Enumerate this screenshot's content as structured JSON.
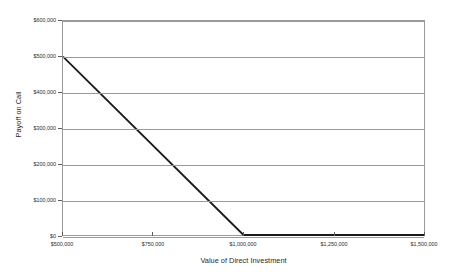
{
  "chart_data": {
    "type": "line",
    "title": "",
    "xlabel": "Value of Direct Investment",
    "ylabel": "Payoff on Call",
    "xlim": [
      500000,
      1500000
    ],
    "ylim": [
      0,
      600000
    ],
    "grid": "horizontal",
    "legend": "none",
    "x_tick_labels": [
      "$500,000",
      "$750,000",
      "$1,000,000",
      "$1,250,000",
      "$1,500,000"
    ],
    "x_ticks": [
      500000,
      750000,
      1000000,
      1250000,
      1500000
    ],
    "y_tick_labels": [
      "$0",
      "$100,000",
      "$200,000",
      "$300,000",
      "$400,000",
      "$500,000",
      "$600,000"
    ],
    "y_ticks": [
      0,
      100000,
      200000,
      300000,
      400000,
      500000,
      600000
    ],
    "series": [
      {
        "name": "Payoff on Call",
        "color": "#1a1a1a",
        "x": [
          500000,
          1000000,
          1500000
        ],
        "values": [
          500000,
          0,
          0
        ]
      }
    ],
    "annotations": []
  },
  "style": {
    "line_color": "#1a1a1a",
    "grid_color": "#9a9a9a",
    "axis_color": "#9a9a9a",
    "background": "#ffffff",
    "text_color": "#2b2b2b"
  }
}
